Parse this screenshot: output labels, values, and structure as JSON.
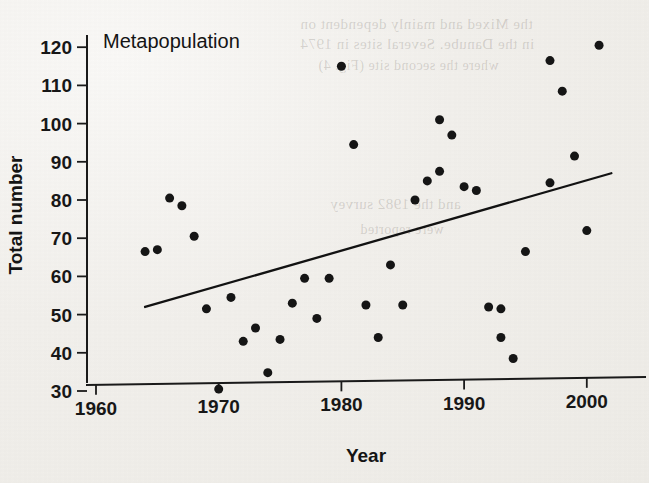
{
  "figure": {
    "panel_label": "Metapopulation",
    "background_color": "#f2f0ec",
    "ink_color": "#151515"
  },
  "bleedthrough": [
    {
      "text": "the Mixed and mainly dependent on",
      "x": 300,
      "y": 16,
      "size": 15
    },
    {
      "text": "in the Danube. Several sites in 1974",
      "x": 300,
      "y": 36,
      "size": 15
    },
    {
      "text": "where the second site (Fig. 4)",
      "x": 318,
      "y": 58,
      "size": 14
    },
    {
      "text": "and the 1982 survey",
      "x": 330,
      "y": 196,
      "size": 15
    },
    {
      "text": "were reported",
      "x": 360,
      "y": 222,
      "size": 14
    }
  ],
  "chart_data": {
    "type": "scatter",
    "title": "Metapopulation",
    "xlabel": "Year",
    "ylabel": "Total number",
    "xlim": [
      1958,
      2004
    ],
    "ylim": [
      26,
      124
    ],
    "xticks": [
      1960,
      1970,
      1980,
      1990,
      2000
    ],
    "yticks": [
      30,
      40,
      50,
      60,
      70,
      80,
      90,
      100,
      110,
      120
    ],
    "grid": false,
    "legend": "none",
    "marker": "filled-circle",
    "marker_size_px": 9,
    "x": [
      1964,
      1965,
      1966,
      1967,
      1968,
      1969,
      1970,
      1971,
      1972,
      1973,
      1974,
      1975,
      1976,
      1977,
      1978,
      1979,
      1980,
      1981,
      1982,
      1983,
      1984,
      1985,
      1986,
      1987,
      1988,
      1988,
      1989,
      1990,
      1991,
      1992,
      1993,
      1993,
      1994,
      1995,
      1997,
      1997,
      1998,
      1999,
      2000,
      2001
    ],
    "y": [
      66.5,
      67,
      80.5,
      78.5,
      70.5,
      51.5,
      30.5,
      54.5,
      43,
      46.5,
      34.8,
      43.5,
      53,
      59.5,
      49,
      59.5,
      115,
      94.5,
      52.5,
      44,
      63,
      52.5,
      80,
      85,
      87.5,
      101,
      97,
      83.5,
      82.5,
      52,
      44,
      51.5,
      38.5,
      66.5,
      84.5,
      116.5,
      108.5,
      91.5,
      72,
      120.5
    ],
    "trend_line": {
      "x_start": 1964,
      "y_start": 52,
      "x_end": 2002,
      "y_end": 87
    }
  },
  "axes": {
    "y_tick_labels": [
      "120",
      "110",
      "100",
      "90",
      "80",
      "70",
      "60",
      "50",
      "40",
      "30"
    ],
    "x_tick_labels": [
      "1960",
      "1970",
      "1980",
      "1990",
      "2000"
    ],
    "y_axis_title": "Total number",
    "x_axis_title": "Year"
  }
}
